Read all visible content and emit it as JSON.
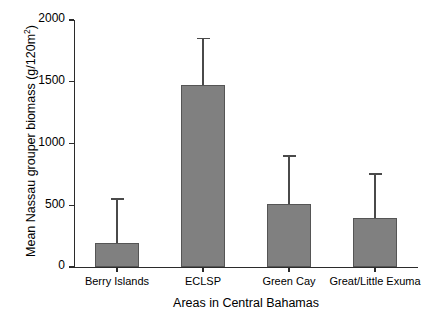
{
  "chart_data": {
    "type": "bar",
    "title": "",
    "xlabel": "Areas in Central Bahamas",
    "ylabel": "Mean Nassau grouper biomass (g/120m",
    "ylabel_superscript": "2",
    "ylabel_suffix": ")",
    "ylabel_full": "Mean Nassau grouper biomass (g/120m2)",
    "categories": [
      "Berry Islands",
      "ECLSP",
      "Green Cay",
      "Great/Little Exuma"
    ],
    "values": [
      195,
      1475,
      510,
      395
    ],
    "error_upper": [
      360,
      380,
      395,
      365
    ],
    "error_top_values": [
      555,
      1855,
      905,
      760
    ],
    "ylim": [
      0,
      2000
    ],
    "yticks": [
      0,
      500,
      1000,
      1500,
      2000
    ],
    "ytick_labels": [
      "0",
      "500",
      "1000",
      "1500",
      "2000"
    ],
    "grid": false,
    "legend": null,
    "bar_color": "#808080",
    "bar_edge_color": "#555555",
    "error_bar_color": "#4a4a4a",
    "axis_color": "#2b2b2b",
    "background_color": "#ffffff"
  }
}
